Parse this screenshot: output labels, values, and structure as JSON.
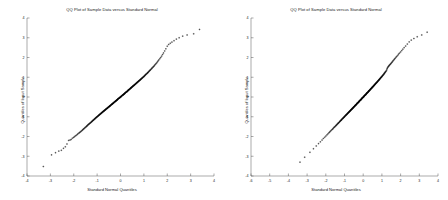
{
  "figure": {
    "background_color": "#ffffff",
    "axis_color": "#555555",
    "marker_color": "#000000",
    "panel_count": 2
  },
  "chart_data": [
    {
      "type": "scatter",
      "title": "QQ Plot of Sample Data versus Standard Normal",
      "xlabel": "Standard Normal Quantiles",
      "ylabel": "Quantiles of Input Sample",
      "xlim": [
        -4,
        4
      ],
      "ylim": [
        -4,
        4
      ],
      "xticks": [
        -4,
        -3,
        -2,
        -1,
        0,
        1,
        2,
        3,
        4
      ],
      "xticklabels": [
        "-4",
        "-3",
        "-2",
        "-1",
        "0",
        "1",
        "2",
        "3",
        "4"
      ],
      "yticks": [
        -4,
        -3,
        -2,
        -1,
        0,
        1,
        2,
        3,
        4
      ],
      "yticklabels": [
        "-4",
        "-3",
        "-2",
        "-1",
        "0",
        "1",
        "2",
        "3",
        "4"
      ],
      "grid": false,
      "legend": null,
      "marker": "+",
      "x": [
        -3.3,
        -2.95,
        -2.78,
        -2.64,
        -2.53,
        -2.44,
        -2.36,
        -2.29,
        -2.22,
        -2.16,
        -2.11,
        -2.06,
        -2.01,
        -1.97,
        -1.93,
        -1.89,
        -1.85,
        -1.82,
        -1.78,
        -1.75,
        -1.72,
        -1.69,
        -1.66,
        -1.63,
        -1.61,
        -1.58,
        -1.56,
        -1.53,
        -1.51,
        -1.48,
        -1.46,
        -1.44,
        -1.42,
        -1.4,
        -1.38,
        -1.36,
        -1.34,
        -1.32,
        -1.3,
        -1.28,
        -1.26,
        -1.24,
        -1.22,
        -1.21,
        -1.19,
        -1.17,
        -1.16,
        -1.14,
        -1.12,
        -1.11,
        -1.09,
        -1.08,
        -1.06,
        -1.05,
        -1.03,
        -1.02,
        -1.0,
        -0.99,
        -0.97,
        -0.96,
        -0.94,
        -0.93,
        -0.92,
        -0.9,
        -0.89,
        -0.88,
        -0.86,
        -0.85,
        -0.84,
        -0.82,
        -0.81,
        -0.8,
        -0.79,
        -0.77,
        -0.76,
        -0.75,
        -0.74,
        -0.72,
        -0.71,
        -0.7,
        -0.69,
        -0.68,
        -0.66,
        -0.65,
        -0.64,
        -0.63,
        -0.62,
        -0.61,
        -0.59,
        -0.58,
        -0.57,
        -0.56,
        -0.55,
        -0.54,
        -0.53,
        -0.51,
        -0.5,
        -0.49,
        -0.48,
        -0.47,
        -0.46,
        -0.45,
        -0.44,
        -0.43,
        -0.42,
        -0.4,
        -0.39,
        -0.38,
        -0.37,
        -0.36,
        -0.35,
        -0.34,
        -0.33,
        -0.32,
        -0.31,
        -0.3,
        -0.29,
        -0.28,
        -0.27,
        -0.25,
        -0.24,
        -0.23,
        -0.22,
        -0.21,
        -0.2,
        -0.19,
        -0.18,
        -0.17,
        -0.16,
        -0.15,
        -0.14,
        -0.13,
        -0.12,
        -0.11,
        -0.1,
        -0.09,
        -0.08,
        -0.06,
        -0.05,
        -0.04,
        -0.03,
        -0.02,
        -0.01,
        0.0,
        0.01,
        0.02,
        0.03,
        0.04,
        0.05,
        0.06,
        0.08,
        0.09,
        0.1,
        0.11,
        0.12,
        0.13,
        0.14,
        0.15,
        0.16,
        0.17,
        0.18,
        0.19,
        0.2,
        0.21,
        0.22,
        0.23,
        0.25,
        0.26,
        0.27,
        0.28,
        0.29,
        0.3,
        0.31,
        0.32,
        0.33,
        0.34,
        0.35,
        0.36,
        0.37,
        0.38,
        0.4,
        0.41,
        0.42,
        0.43,
        0.44,
        0.45,
        0.46,
        0.47,
        0.48,
        0.5,
        0.51,
        0.52,
        0.53,
        0.54,
        0.55,
        0.57,
        0.58,
        0.59,
        0.6,
        0.61,
        0.63,
        0.64,
        0.65,
        0.66,
        0.68,
        0.69,
        0.7,
        0.71,
        0.73,
        0.74,
        0.75,
        0.77,
        0.78,
        0.79,
        0.81,
        0.82,
        0.84,
        0.85,
        0.86,
        0.88,
        0.89,
        0.91,
        0.92,
        0.94,
        0.95,
        0.97,
        0.99,
        1.0,
        1.02,
        1.03,
        1.05,
        1.07,
        1.08,
        1.1,
        1.12,
        1.14,
        1.16,
        1.17,
        1.19,
        1.21,
        1.23,
        1.25,
        1.27,
        1.29,
        1.32,
        1.34,
        1.36,
        1.39,
        1.41,
        1.44,
        1.46,
        1.49,
        1.52,
        1.55,
        1.58,
        1.61,
        1.64,
        1.68,
        1.72,
        1.76,
        1.8,
        1.84,
        1.89,
        1.94,
        2.0,
        2.06,
        2.13,
        2.2,
        2.29,
        2.39,
        2.51,
        2.66,
        2.85,
        3.13,
        3.38
      ],
      "y": [
        -3.52,
        -2.93,
        -2.82,
        -2.74,
        -2.7,
        -2.6,
        -2.52,
        -2.38,
        -2.2,
        -2.18,
        -2.15,
        -2.09,
        -2.05,
        -2.01,
        -1.97,
        -1.94,
        -1.9,
        -1.86,
        -1.83,
        -1.8,
        -1.77,
        -1.74,
        -1.71,
        -1.68,
        -1.65,
        -1.62,
        -1.6,
        -1.57,
        -1.54,
        -1.52,
        -1.49,
        -1.47,
        -1.45,
        -1.42,
        -1.4,
        -1.38,
        -1.36,
        -1.34,
        -1.32,
        -1.3,
        -1.28,
        -1.26,
        -1.24,
        -1.22,
        -1.2,
        -1.18,
        -1.17,
        -1.15,
        -1.13,
        -1.11,
        -1.1,
        -1.08,
        -1.06,
        -1.05,
        -1.03,
        -1.02,
        -1.0,
        -0.99,
        -0.97,
        -0.96,
        -0.94,
        -0.93,
        -0.91,
        -0.9,
        -0.89,
        -0.87,
        -0.86,
        -0.85,
        -0.83,
        -0.82,
        -0.81,
        -0.79,
        -0.78,
        -0.77,
        -0.76,
        -0.74,
        -0.73,
        -0.72,
        -0.71,
        -0.7,
        -0.68,
        -0.67,
        -0.66,
        -0.65,
        -0.64,
        -0.63,
        -0.61,
        -0.6,
        -0.59,
        -0.58,
        -0.57,
        -0.56,
        -0.55,
        -0.54,
        -0.52,
        -0.51,
        -0.5,
        -0.49,
        -0.48,
        -0.47,
        -0.46,
        -0.45,
        -0.44,
        -0.43,
        -0.41,
        -0.4,
        -0.39,
        -0.38,
        -0.37,
        -0.36,
        -0.35,
        -0.34,
        -0.33,
        -0.32,
        -0.31,
        -0.3,
        -0.29,
        -0.28,
        -0.26,
        -0.25,
        -0.24,
        -0.23,
        -0.22,
        -0.21,
        -0.2,
        -0.19,
        -0.18,
        -0.17,
        -0.16,
        -0.15,
        -0.14,
        -0.13,
        -0.12,
        -0.1,
        -0.09,
        -0.08,
        -0.07,
        -0.06,
        -0.05,
        -0.04,
        -0.03,
        -0.02,
        -0.01,
        0.0,
        0.01,
        0.02,
        0.03,
        0.04,
        0.05,
        0.07,
        0.08,
        0.09,
        0.1,
        0.11,
        0.12,
        0.13,
        0.14,
        0.15,
        0.16,
        0.17,
        0.18,
        0.19,
        0.21,
        0.22,
        0.23,
        0.24,
        0.25,
        0.26,
        0.27,
        0.28,
        0.29,
        0.3,
        0.31,
        0.33,
        0.34,
        0.35,
        0.36,
        0.37,
        0.38,
        0.39,
        0.4,
        0.42,
        0.43,
        0.44,
        0.45,
        0.46,
        0.47,
        0.49,
        0.5,
        0.51,
        0.52,
        0.53,
        0.55,
        0.56,
        0.57,
        0.58,
        0.59,
        0.61,
        0.62,
        0.63,
        0.64,
        0.66,
        0.67,
        0.68,
        0.7,
        0.71,
        0.72,
        0.74,
        0.75,
        0.76,
        0.78,
        0.79,
        0.81,
        0.82,
        0.83,
        0.85,
        0.86,
        0.88,
        0.89,
        0.91,
        0.92,
        0.94,
        0.96,
        0.97,
        0.99,
        1.01,
        1.02,
        1.04,
        1.06,
        1.08,
        1.1,
        1.12,
        1.14,
        1.16,
        1.18,
        1.2,
        1.22,
        1.24,
        1.26,
        1.29,
        1.31,
        1.34,
        1.36,
        1.39,
        1.42,
        1.45,
        1.48,
        1.51,
        1.54,
        1.57,
        1.61,
        1.65,
        1.69,
        1.73,
        1.78,
        1.83,
        1.88,
        1.94,
        2.0,
        2.07,
        2.15,
        2.23,
        2.33,
        2.44,
        2.57,
        2.66,
        2.72,
        2.78,
        2.85,
        2.93,
        3.0,
        3.08,
        3.14,
        3.2,
        3.42
      ]
    },
    {
      "type": "scatter",
      "title": "QQ Plot of Sample Data versus Standard Normal",
      "xlabel": "Standard Normal Quantiles",
      "ylabel": "Quantiles of Input Sample",
      "xlim": [
        -6,
        4
      ],
      "ylim": [
        -4,
        4
      ],
      "xticks": [
        -6,
        -5,
        -4,
        -3,
        -2,
        -1,
        0,
        1,
        2,
        3,
        4
      ],
      "xticklabels": [
        "-6",
        "-5",
        "-4",
        "-3",
        "-2",
        "-1",
        "0",
        "1",
        "2",
        "3",
        "4"
      ],
      "yticks": [
        -4,
        -3,
        -2,
        -1,
        0,
        1,
        2,
        3,
        4
      ],
      "yticklabels": [
        "-4",
        "-3",
        "-2",
        "-1",
        "0",
        "1",
        "2",
        "3",
        "4"
      ],
      "grid": false,
      "legend": null,
      "marker": "+",
      "x": [
        -3.38,
        -3.13,
        -2.85,
        -2.66,
        -2.51,
        -2.39,
        -2.29,
        -2.2,
        -2.13,
        -2.06,
        -2.0,
        -1.94,
        -1.89,
        -1.84,
        -1.8,
        -1.76,
        -1.72,
        -1.68,
        -1.64,
        -1.61,
        -1.58,
        -1.55,
        -1.52,
        -1.49,
        -1.46,
        -1.44,
        -1.41,
        -1.39,
        -1.36,
        -1.34,
        -1.32,
        -1.29,
        -1.27,
        -1.25,
        -1.23,
        -1.21,
        -1.19,
        -1.17,
        -1.16,
        -1.14,
        -1.12,
        -1.1,
        -1.08,
        -1.07,
        -1.05,
        -1.03,
        -1.02,
        -1.0,
        -0.99,
        -0.97,
        -0.95,
        -0.94,
        -0.92,
        -0.91,
        -0.89,
        -0.88,
        -0.86,
        -0.85,
        -0.84,
        -0.82,
        -0.81,
        -0.79,
        -0.78,
        -0.77,
        -0.75,
        -0.74,
        -0.73,
        -0.71,
        -0.7,
        -0.69,
        -0.68,
        -0.66,
        -0.65,
        -0.64,
        -0.63,
        -0.61,
        -0.6,
        -0.59,
        -0.58,
        -0.57,
        -0.55,
        -0.54,
        -0.53,
        -0.52,
        -0.51,
        -0.5,
        -0.48,
        -0.47,
        -0.46,
        -0.45,
        -0.44,
        -0.43,
        -0.42,
        -0.4,
        -0.39,
        -0.38,
        -0.37,
        -0.36,
        -0.35,
        -0.34,
        -0.33,
        -0.32,
        -0.31,
        -0.29,
        -0.28,
        -0.27,
        -0.26,
        -0.25,
        -0.24,
        -0.23,
        -0.22,
        -0.21,
        -0.2,
        -0.19,
        -0.18,
        -0.16,
        -0.15,
        -0.14,
        -0.13,
        -0.12,
        -0.11,
        -0.1,
        -0.09,
        -0.08,
        -0.07,
        -0.06,
        -0.05,
        -0.04,
        -0.02,
        -0.01,
        0.0,
        0.01,
        0.02,
        0.03,
        0.04,
        0.05,
        0.06,
        0.07,
        0.08,
        0.09,
        0.11,
        0.12,
        0.13,
        0.14,
        0.15,
        0.16,
        0.17,
        0.18,
        0.19,
        0.2,
        0.21,
        0.22,
        0.24,
        0.25,
        0.26,
        0.27,
        0.28,
        0.29,
        0.3,
        0.31,
        0.32,
        0.33,
        0.35,
        0.36,
        0.37,
        0.38,
        0.39,
        0.4,
        0.41,
        0.42,
        0.44,
        0.45,
        0.46,
        0.47,
        0.48,
        0.49,
        0.51,
        0.52,
        0.53,
        0.54,
        0.55,
        0.57,
        0.58,
        0.59,
        0.6,
        0.61,
        0.63,
        0.64,
        0.65,
        0.66,
        0.68,
        0.69,
        0.7,
        0.72,
        0.73,
        0.74,
        0.76,
        0.77,
        0.78,
        0.8,
        0.81,
        0.83,
        0.84,
        0.85,
        0.87,
        0.88,
        0.9,
        0.91,
        0.93,
        0.94,
        0.96,
        0.98,
        0.99,
        1.01,
        1.03,
        1.04,
        1.06,
        1.08,
        1.1,
        1.12,
        1.13,
        1.15,
        1.17,
        1.19,
        1.21,
        1.24,
        1.26,
        1.28,
        1.3,
        1.33,
        1.35,
        1.38,
        1.4,
        1.43,
        1.46,
        1.49,
        1.52,
        1.55,
        1.58,
        1.61,
        1.65,
        1.68,
        1.72,
        1.76,
        1.8,
        1.85,
        1.89,
        1.94,
        2.0,
        2.06,
        2.12,
        2.19,
        2.27,
        2.36,
        2.46,
        2.57,
        2.71,
        2.89,
        3.13,
        3.42
      ],
      "y": [
        -3.3,
        -3.05,
        -2.8,
        -2.62,
        -2.48,
        -2.36,
        -2.27,
        -2.18,
        -2.1,
        -2.04,
        -1.98,
        -1.92,
        -1.87,
        -1.82,
        -1.78,
        -1.74,
        -1.7,
        -1.66,
        -1.63,
        -1.6,
        -1.56,
        -1.53,
        -1.51,
        -1.48,
        -1.45,
        -1.43,
        -1.4,
        -1.38,
        -1.35,
        -1.33,
        -1.31,
        -1.29,
        -1.26,
        -1.24,
        -1.22,
        -1.2,
        -1.18,
        -1.17,
        -1.15,
        -1.13,
        -1.11,
        -1.09,
        -1.08,
        -1.06,
        -1.04,
        -1.03,
        -1.01,
        -1.0,
        -0.98,
        -0.96,
        -0.95,
        -0.93,
        -0.92,
        -0.9,
        -0.89,
        -0.88,
        -0.86,
        -0.85,
        -0.83,
        -0.82,
        -0.81,
        -0.79,
        -0.78,
        -0.77,
        -0.75,
        -0.74,
        -0.73,
        -0.72,
        -0.7,
        -0.69,
        -0.68,
        -0.67,
        -0.65,
        -0.64,
        -0.63,
        -0.62,
        -0.61,
        -0.59,
        -0.58,
        -0.57,
        -0.56,
        -0.55,
        -0.54,
        -0.52,
        -0.51,
        -0.5,
        -0.49,
        -0.48,
        -0.47,
        -0.46,
        -0.44,
        -0.43,
        -0.42,
        -0.41,
        -0.4,
        -0.39,
        -0.38,
        -0.37,
        -0.36,
        -0.34,
        -0.33,
        -0.32,
        -0.31,
        -0.3,
        -0.29,
        -0.28,
        -0.27,
        -0.26,
        -0.25,
        -0.24,
        -0.23,
        -0.21,
        -0.2,
        -0.19,
        -0.18,
        -0.17,
        -0.16,
        -0.15,
        -0.14,
        -0.13,
        -0.12,
        -0.11,
        -0.1,
        -0.09,
        -0.07,
        -0.06,
        -0.05,
        -0.04,
        -0.03,
        -0.02,
        -0.01,
        0.0,
        0.01,
        0.02,
        0.03,
        0.05,
        0.06,
        0.07,
        0.08,
        0.09,
        0.1,
        0.11,
        0.12,
        0.13,
        0.14,
        0.15,
        0.17,
        0.18,
        0.19,
        0.2,
        0.21,
        0.22,
        0.23,
        0.24,
        0.25,
        0.27,
        0.28,
        0.29,
        0.3,
        0.31,
        0.32,
        0.33,
        0.34,
        0.36,
        0.37,
        0.38,
        0.39,
        0.4,
        0.41,
        0.43,
        0.44,
        0.45,
        0.46,
        0.47,
        0.49,
        0.5,
        0.51,
        0.52,
        0.53,
        0.55,
        0.56,
        0.57,
        0.58,
        0.6,
        0.61,
        0.62,
        0.64,
        0.65,
        0.66,
        0.68,
        0.69,
        0.7,
        0.72,
        0.73,
        0.74,
        0.76,
        0.77,
        0.79,
        0.8,
        0.82,
        0.83,
        0.85,
        0.86,
        0.88,
        0.89,
        0.91,
        0.93,
        0.94,
        0.96,
        0.98,
        1.0,
        1.01,
        1.03,
        1.05,
        1.07,
        1.09,
        1.11,
        1.13,
        1.15,
        1.18,
        1.2,
        1.22,
        1.25,
        1.27,
        1.3,
        1.33,
        1.38,
        1.44,
        1.48,
        1.52,
        1.55,
        1.58,
        1.61,
        1.64,
        1.67,
        1.7,
        1.74,
        1.77,
        1.81,
        1.85,
        1.89,
        1.93,
        1.97,
        2.02,
        2.06,
        2.11,
        2.17,
        2.22,
        2.28,
        2.35,
        2.42,
        2.5,
        2.58,
        2.68,
        2.79,
        2.88,
        2.96,
        3.05,
        3.14,
        3.28
      ]
    }
  ]
}
